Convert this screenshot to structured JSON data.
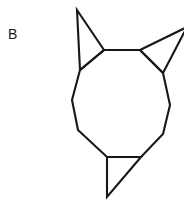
{
  "figure": {
    "label": "B",
    "label_position": {
      "x": 8,
      "y": 26
    },
    "background_color": "#ffffff",
    "stroke_color": "#17171a",
    "stroke_width": 2.1,
    "canvas": {
      "width": 184,
      "height": 202
    },
    "shapes": [
      {
        "name": "central-nonagon",
        "type": "polygon",
        "closed": true,
        "points": [
          [
            80,
            70
          ],
          [
            104,
            50
          ],
          [
            140,
            50
          ],
          [
            163,
            73
          ],
          [
            170,
            105
          ],
          [
            163,
            134
          ],
          [
            141,
            157
          ],
          [
            107,
            157
          ],
          [
            78,
            130
          ],
          [
            72,
            100
          ]
        ]
      },
      {
        "name": "upper-left-spike-triangle",
        "type": "polygon",
        "closed": true,
        "points": [
          [
            77,
            10
          ],
          [
            104,
            50
          ],
          [
            80,
            70
          ]
        ]
      },
      {
        "name": "upper-right-spike-triangle",
        "type": "polygon",
        "closed": true,
        "points": [
          [
            140,
            50
          ],
          [
            187,
            27
          ],
          [
            163,
            73
          ]
        ]
      },
      {
        "name": "bottom-spike-triangle",
        "type": "polygon",
        "closed": true,
        "points": [
          [
            107,
            157
          ],
          [
            141,
            157
          ],
          [
            107,
            197
          ]
        ]
      }
    ]
  }
}
